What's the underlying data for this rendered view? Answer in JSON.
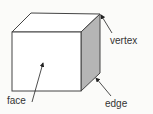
{
  "diagram": {
    "labels": {
      "vertex": "vertex",
      "face": "face",
      "edge": "edge"
    },
    "colors": {
      "background": "#fbfbf9",
      "line": "#444444",
      "side_face": "#b5b5b5",
      "front_face": "#ffffff"
    }
  }
}
